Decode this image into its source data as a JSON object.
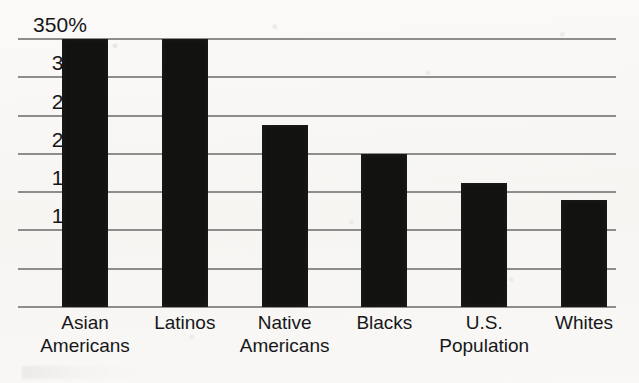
{
  "chart_data": {
    "type": "bar",
    "title": "",
    "subtitle": "",
    "xlabel": "",
    "ylabel": "",
    "categories": [
      "Asian Americans",
      "Latinos",
      "Native Americans",
      "Blacks",
      "U.S. Population",
      "Whites"
    ],
    "category_lines": [
      [
        "Asian",
        "Americans"
      ],
      [
        "Latinos",
        ""
      ],
      [
        "Native",
        "Americans"
      ],
      [
        "Blacks",
        ""
      ],
      [
        "U.S.",
        "Population"
      ],
      [
        "Whites",
        ""
      ]
    ],
    "values": [
      350,
      350,
      238,
      200,
      162,
      140
    ],
    "value_notes": [
      "clipped at axis maximum",
      "clipped at axis maximum",
      "",
      "",
      "",
      ""
    ],
    "ylim": [
      0,
      350
    ],
    "ytick_values": [
      350,
      300,
      250,
      200,
      150,
      100,
      50,
      0
    ],
    "ytick_labels": [
      "350%",
      "300",
      "250",
      "200",
      "150",
      "100",
      "50",
      "0"
    ],
    "unit": "%",
    "grid": true,
    "grid_orientation": "horizontal",
    "legend": false,
    "legend_position": "none",
    "bar_color": "#121211",
    "grid_color": "#8e8d8b",
    "background_color": "#f8f7f5",
    "text_color": "#17171a"
  },
  "axes": {
    "y_axis_name": "y-axis",
    "x_axis_name": "x-axis"
  }
}
